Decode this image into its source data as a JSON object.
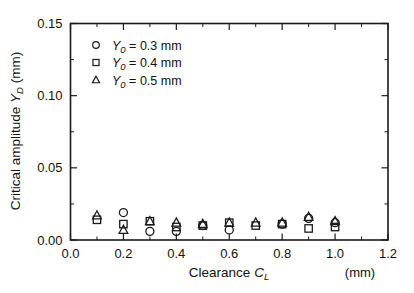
{
  "chart_data": {
    "type": "scatter",
    "title": "",
    "xlabel": "Clearance  C_L",
    "xlabel_main": "Clearance",
    "xlabel_symbol": "C",
    "xlabel_symbol_sub": "L",
    "xunit": "(mm)",
    "ylabel": "Critical amplitude  Y_D  (mm)",
    "ylabel_main": "Critical amplitude",
    "ylabel_symbol": "Y",
    "ylabel_symbol_sub": "D",
    "yunit": "(mm)",
    "xlim": [
      0.0,
      1.2
    ],
    "ylim": [
      0.0,
      0.15
    ],
    "xticks": [
      "0.0",
      "0.2",
      "0.4",
      "0.6",
      "0.8",
      "1.0",
      "1.2"
    ],
    "xtick_values": [
      0.0,
      0.2,
      0.4,
      0.6,
      0.8,
      1.0,
      1.2
    ],
    "xticks_minor": [
      0.1,
      0.3,
      0.5,
      0.7,
      0.9,
      1.1
    ],
    "yticks": [
      "0.00",
      "0.05",
      "0.10",
      "0.15"
    ],
    "ytick_values": [
      0.0,
      0.05,
      0.1,
      0.15
    ],
    "yticks_minor": [
      0.025,
      0.075,
      0.125
    ],
    "grid": false,
    "legend_position": "top-left inside axes",
    "series": [
      {
        "name": "Y_0 = 0.3 mm",
        "label_symbol": "Y",
        "label_sub": "0",
        "label_value": "= 0.3 mm",
        "marker": "circle",
        "x": [
          0.2,
          0.3,
          0.4,
          0.5,
          0.6,
          0.8,
          0.9,
          1.0
        ],
        "y": [
          0.019,
          0.006,
          0.006,
          0.01,
          0.007,
          0.011,
          0.015,
          0.012
        ]
      },
      {
        "name": "Y_0 = 0.4 mm",
        "label_symbol": "Y",
        "label_sub": "0",
        "label_value": "= 0.4 mm",
        "marker": "square",
        "x": [
          0.1,
          0.2,
          0.3,
          0.4,
          0.5,
          0.6,
          0.7,
          0.8,
          0.9,
          1.0
        ],
        "y": [
          0.014,
          0.011,
          0.013,
          0.009,
          0.01,
          0.012,
          0.01,
          0.011,
          0.008,
          0.009
        ]
      },
      {
        "name": "Y_0 = 0.5 mm",
        "label_symbol": "Y",
        "label_sub": "0",
        "label_value": "= 0.5 mm",
        "marker": "triangle",
        "x": [
          0.1,
          0.2,
          0.3,
          0.4,
          0.5,
          0.6,
          0.7,
          0.8,
          0.9,
          1.0
        ],
        "y": [
          0.017,
          0.007,
          0.013,
          0.012,
          0.011,
          0.012,
          0.012,
          0.012,
          0.016,
          0.013
        ]
      }
    ],
    "colors": {
      "ink": "#111111",
      "background": "#ffffff"
    }
  }
}
